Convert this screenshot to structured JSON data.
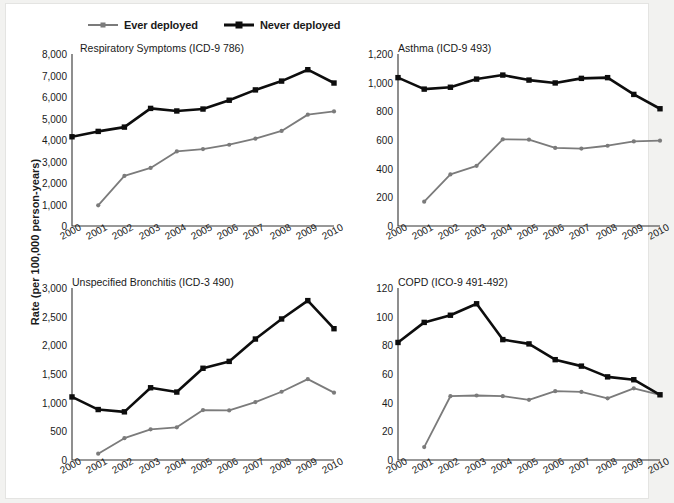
{
  "figure": {
    "y_axis_caption": "Rate (per 100,000 person-years)",
    "background": "#ffffff",
    "page_background": "#f2f2f0"
  },
  "legend": {
    "position": "top-left",
    "items": [
      {
        "label": "Ever deployed",
        "color": "#7b7b7b",
        "marker": "circle",
        "line_width": 2
      },
      {
        "label": "Never deployed",
        "color": "#0d0d0d",
        "marker": "square",
        "line_width": 3
      }
    ]
  },
  "chart_data": [
    {
      "type": "line",
      "title": "Respiratory Symptoms (ICD-9 786)",
      "xlabel": "",
      "ylabel": "Rate (per 100,000 person-years)",
      "x": [
        "2000",
        "2001",
        "2002",
        "2003",
        "2004",
        "2005",
        "2006",
        "2007",
        "2008",
        "2009",
        "2010"
      ],
      "ylim": [
        0,
        8000
      ],
      "yticks": [
        0,
        1000,
        2000,
        3000,
        4000,
        5000,
        6000,
        7000,
        8000
      ],
      "ytick_labels": [
        "0",
        "1,000",
        "2,000",
        "3,000",
        "4,000",
        "5,000",
        "6,000",
        "7,000",
        "8,000"
      ],
      "grid": false,
      "legend_position": "figure-top",
      "series": [
        {
          "name": "Ever deployed",
          "color": "#7b7b7b",
          "values": [
            null,
            960,
            2330,
            2700,
            3470,
            3580,
            3780,
            4060,
            4420,
            5180,
            5330
          ]
        },
        {
          "name": "Never deployed",
          "color": "#0d0d0d",
          "values": [
            4150,
            4400,
            4600,
            5470,
            5350,
            5440,
            5850,
            6330,
            6740,
            7270,
            6650
          ]
        }
      ]
    },
    {
      "type": "line",
      "title": "Asthma (ICD-9 493)",
      "xlabel": "",
      "ylabel": "Rate (per 100,000 person-years)",
      "x": [
        "2000",
        "2001",
        "2002",
        "2003",
        "2004",
        "2005",
        "2006",
        "2007",
        "2008",
        "2009",
        "2010"
      ],
      "ylim": [
        0,
        1200
      ],
      "yticks": [
        0,
        200,
        400,
        600,
        800,
        1000,
        1200
      ],
      "ytick_labels": [
        "0",
        "200",
        "400",
        "600",
        "800",
        "1,000",
        "1,200"
      ],
      "grid": false,
      "legend_position": "figure-top",
      "series": [
        {
          "name": "Ever deployed",
          "color": "#7b7b7b",
          "values": [
            null,
            170,
            360,
            420,
            605,
            602,
            545,
            540,
            560,
            590,
            595
          ]
        },
        {
          "name": "Never deployed",
          "color": "#0d0d0d",
          "values": [
            1035,
            955,
            968,
            1025,
            1053,
            1018,
            998,
            1030,
            1035,
            918,
            818
          ]
        }
      ]
    },
    {
      "type": "line",
      "title": "Unspecified Bronchitis (ICD-3 490)",
      "xlabel": "",
      "ylabel": "Rate (per 100,000 person-years)",
      "x": [
        "2000",
        "2001",
        "2002",
        "2003",
        "2004",
        "2005",
        "2006",
        "2007",
        "2008",
        "2009",
        "2010"
      ],
      "ylim": [
        0,
        3000
      ],
      "yticks": [
        0,
        500,
        1000,
        1500,
        2000,
        2500,
        3000
      ],
      "ytick_labels": [
        "0",
        "500",
        "1,000",
        "1,500",
        "2,000",
        "2,500",
        "3,000"
      ],
      "grid": false,
      "legend_position": "figure-top",
      "series": [
        {
          "name": "Ever deployed",
          "color": "#7b7b7b",
          "values": [
            null,
            110,
            380,
            535,
            570,
            870,
            865,
            1010,
            1190,
            1410,
            1175
          ]
        },
        {
          "name": "Never deployed",
          "color": "#0d0d0d",
          "values": [
            1100,
            880,
            840,
            1260,
            1185,
            1600,
            1720,
            2110,
            2460,
            2780,
            2290
          ]
        }
      ]
    },
    {
      "type": "line",
      "title": "COPD (ICO-9 491-492)",
      "xlabel": "",
      "ylabel": "Rate (per 100,000 person-years)",
      "x": [
        "2000",
        "2001",
        "2002",
        "2003",
        "2004",
        "2005",
        "2006",
        "2007",
        "2008",
        "2009",
        "2010"
      ],
      "ylim": [
        0,
        120
      ],
      "yticks": [
        0,
        20,
        40,
        60,
        80,
        100,
        120
      ],
      "ytick_labels": [
        "0",
        "20",
        "40",
        "60",
        "80",
        "100",
        "120"
      ],
      "grid": false,
      "legend_position": "figure-top",
      "series": [
        {
          "name": "Ever deployed",
          "color": "#7b7b7b",
          "values": [
            null,
            9,
            44.5,
            45,
            44.5,
            42,
            48,
            47.5,
            43,
            50,
            45.5
          ]
        },
        {
          "name": "Never deployed",
          "color": "#0d0d0d",
          "values": [
            82,
            96,
            101,
            109,
            84,
            81,
            70,
            65.5,
            58,
            56,
            45.5
          ]
        }
      ]
    }
  ]
}
